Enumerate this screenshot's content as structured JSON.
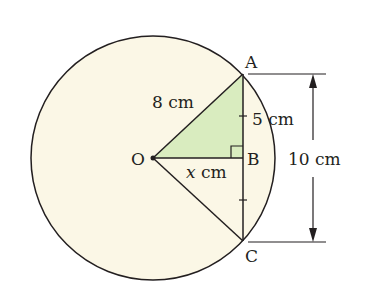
{
  "diagram": {
    "colors": {
      "circle_fill": "#fbf7e6",
      "triangle_fill": "#d9ecbf",
      "stroke": "#231f20",
      "background": "#ffffff"
    },
    "points": {
      "O": "O",
      "A": "A",
      "B": "B",
      "C": "C"
    },
    "labels": {
      "radius": "8 cm",
      "half_chord": "5 cm",
      "distance_var": "x",
      "distance_unit": " cm",
      "chord": "10 cm"
    }
  }
}
